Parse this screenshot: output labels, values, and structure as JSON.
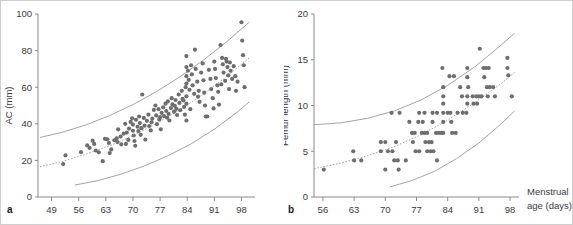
{
  "figure": {
    "panel_letters": {
      "a": "a",
      "b": "b"
    },
    "shared_x_axis_title_line1": "Menstrual",
    "shared_x_axis_title_line2": "age (days)"
  },
  "chart_data": [
    {
      "type": "scatter",
      "panel": "a",
      "title": "",
      "xlabel": "Menstrual age (days)",
      "ylabel": "AC (mm)",
      "xlim": [
        45.5,
        101.5
      ],
      "ylim": [
        0,
        100
      ],
      "xticks": [
        49,
        56,
        63,
        70,
        77,
        84,
        91,
        98
      ],
      "yticks": [
        0,
        20,
        40,
        60,
        80,
        100
      ],
      "grid": false,
      "legend": "none",
      "annotations": [
        "upper reference percentile curve",
        "mean dotted curve",
        "lower reference percentile curve"
      ],
      "curves": [
        {
          "name": "upper",
          "x": [
            46,
            52,
            58,
            64,
            70,
            76,
            82,
            88,
            94,
            100
          ],
          "y": [
            32.5,
            35.5,
            39.5,
            44.5,
            50.5,
            57.5,
            65.5,
            74.5,
            84.5,
            95.5
          ]
        },
        {
          "name": "mean",
          "x": [
            46,
            52,
            58,
            64,
            70,
            76,
            82,
            88,
            94,
            100
          ],
          "y": [
            16.5,
            19.5,
            23.5,
            28.0,
            33.5,
            40.0,
            47.5,
            56.0,
            65.5,
            76.0
          ]
        },
        {
          "name": "lower",
          "x": [
            55,
            61,
            67,
            73,
            79,
            85,
            91,
            97,
            100
          ],
          "y": [
            6.5,
            9.0,
            12.5,
            17.0,
            22.5,
            29.0,
            37.0,
            46.5,
            52.0
          ]
        }
      ],
      "points": [
        [
          52.0,
          18.0
        ],
        [
          52.6,
          22.7
        ],
        [
          56.6,
          24.5
        ],
        [
          58.2,
          28.2
        ],
        [
          58.8,
          26.8
        ],
        [
          59.6,
          30.8
        ],
        [
          60.4,
          25.4
        ],
        [
          61.2,
          24.4
        ],
        [
          62.2,
          19.6
        ],
        [
          63.4,
          31.5
        ],
        [
          63.8,
          29.5
        ],
        [
          64.0,
          24.0
        ],
        [
          64.4,
          26.0
        ],
        [
          65.2,
          31.0
        ],
        [
          65.8,
          32.0
        ],
        [
          66.2,
          37.0
        ],
        [
          66.8,
          33.0
        ],
        [
          67.0,
          28.8
        ],
        [
          67.6,
          34.6
        ],
        [
          68.0,
          40.0
        ],
        [
          68.4,
          35.2
        ],
        [
          68.8,
          31.2
        ],
        [
          69.0,
          37.4
        ],
        [
          69.4,
          41.0
        ],
        [
          69.8,
          43.0
        ],
        [
          70.0,
          39.6
        ],
        [
          70.2,
          33.6
        ],
        [
          70.4,
          30.6
        ],
        [
          70.6,
          28.0
        ],
        [
          70.8,
          42.2
        ],
        [
          71.2,
          38.4
        ],
        [
          71.4,
          36.0
        ],
        [
          71.6,
          44.0
        ],
        [
          71.8,
          40.4
        ],
        [
          72.0,
          34.0
        ],
        [
          72.4,
          56.0
        ],
        [
          72.8,
          43.2
        ],
        [
          73.0,
          39.0
        ],
        [
          73.2,
          31.4
        ],
        [
          73.6,
          41.6
        ],
        [
          74.0,
          45.0
        ],
        [
          74.2,
          38.8
        ],
        [
          74.6,
          36.4
        ],
        [
          75.0,
          42.8
        ],
        [
          75.4,
          47.6
        ],
        [
          75.8,
          50.0
        ],
        [
          76.0,
          44.6
        ],
        [
          76.2,
          39.8
        ],
        [
          76.6,
          48.0
        ],
        [
          77.0,
          43.6
        ],
        [
          77.2,
          37.0
        ],
        [
          77.4,
          46.0
        ],
        [
          77.8,
          49.0
        ],
        [
          78.0,
          44.2
        ],
        [
          78.4,
          51.0
        ],
        [
          78.6,
          47.0
        ],
        [
          79.0,
          52.2
        ],
        [
          79.2,
          45.4
        ],
        [
          79.4,
          41.8
        ],
        [
          79.8,
          48.6
        ],
        [
          80.0,
          54.0
        ],
        [
          80.2,
          50.6
        ],
        [
          80.6,
          46.6
        ],
        [
          81.0,
          53.0
        ],
        [
          81.2,
          48.2
        ],
        [
          81.4,
          44.8
        ],
        [
          81.8,
          56.0
        ],
        [
          82.0,
          51.4
        ],
        [
          82.2,
          47.4
        ],
        [
          82.6,
          58.0
        ],
        [
          83.0,
          52.8
        ],
        [
          83.2,
          49.2
        ],
        [
          83.4,
          45.0
        ],
        [
          83.6,
          60.0
        ],
        [
          83.8,
          77.0
        ],
        [
          83.8,
          71.0
        ],
        [
          83.8,
          66.0
        ],
        [
          83.8,
          62.0
        ],
        [
          83.8,
          55.0
        ],
        [
          83.8,
          51.0
        ],
        [
          83.8,
          41.8
        ],
        [
          84.2,
          69.0
        ],
        [
          84.4,
          64.0
        ],
        [
          84.6,
          58.6
        ],
        [
          85.0,
          72.0
        ],
        [
          85.2,
          67.0
        ],
        [
          85.4,
          61.0
        ],
        [
          85.8,
          56.4
        ],
        [
          86.0,
          80.5
        ],
        [
          86.2,
          70.0
        ],
        [
          86.6,
          63.0
        ],
        [
          87.0,
          58.0
        ],
        [
          87.2,
          52.0
        ],
        [
          87.6,
          68.0
        ],
        [
          88.0,
          73.0
        ],
        [
          88.2,
          63.8
        ],
        [
          88.4,
          57.0
        ],
        [
          88.8,
          44.0
        ],
        [
          89.2,
          44.0
        ],
        [
          89.6,
          69.5
        ],
        [
          90.0,
          64.5
        ],
        [
          90.2,
          59.0
        ],
        [
          90.6,
          54.0
        ],
        [
          91.0,
          74.0
        ],
        [
          91.2,
          70.0
        ],
        [
          91.4,
          65.0
        ],
        [
          91.8,
          61.0
        ],
        [
          92.0,
          57.5
        ],
        [
          92.2,
          50.5
        ],
        [
          92.6,
          83.0
        ],
        [
          93.0,
          76.0
        ],
        [
          93.2,
          72.5
        ],
        [
          93.4,
          68.0
        ],
        [
          93.8,
          63.5
        ],
        [
          94.0,
          75.5
        ],
        [
          94.2,
          74.0
        ],
        [
          94.4,
          71.0
        ],
        [
          94.6,
          66.5
        ],
        [
          95.0,
          73.5
        ],
        [
          95.2,
          69.0
        ],
        [
          95.6,
          64.5
        ],
        [
          96.0,
          71.5
        ],
        [
          96.4,
          66.0
        ],
        [
          97.0,
          63.0
        ],
        [
          98.0,
          95.5
        ],
        [
          98.2,
          85.5
        ],
        [
          98.4,
          77.5
        ],
        [
          98.6,
          72.0
        ],
        [
          98.8,
          60.0
        ],
        [
          60.0,
          29.0
        ],
        [
          62.8,
          31.8
        ],
        [
          66.0,
          30.0
        ],
        [
          68.2,
          29.0
        ],
        [
          70.0,
          36.2
        ],
        [
          72.2,
          37.6
        ],
        [
          74.8,
          40.8
        ],
        [
          76.8,
          42.4
        ],
        [
          78.8,
          43.4
        ],
        [
          80.8,
          49.8
        ],
        [
          82.8,
          53.6
        ],
        [
          84.8,
          48.0
        ],
        [
          86.8,
          54.8
        ],
        [
          88.6,
          50.0
        ],
        [
          90.8,
          48.4
        ],
        [
          92.8,
          61.5
        ],
        [
          94.8,
          59.0
        ],
        [
          96.6,
          58.0
        ]
      ]
    },
    {
      "type": "scatter",
      "panel": "b",
      "title": "",
      "xlabel": "Menstrual age (days)",
      "ylabel": "Femur length (mm)",
      "xlim": [
        54,
        100
      ],
      "ylim": [
        0,
        20
      ],
      "xticks": [
        56,
        63,
        70,
        77,
        84,
        91,
        98
      ],
      "yticks": [
        0,
        5,
        10,
        15,
        20
      ],
      "grid": false,
      "legend": "none",
      "annotations": [
        "upper reference percentile curve",
        "mean dotted curve",
        "lower reference percentile curve"
      ],
      "curves": [
        {
          "name": "upper",
          "x": [
            54,
            60,
            66,
            72,
            78,
            84,
            90,
            96,
            99
          ],
          "y": [
            7.9,
            8.1,
            8.6,
            9.4,
            10.6,
            12.2,
            14.2,
            16.6,
            17.9
          ]
        },
        {
          "name": "mean",
          "x": [
            54,
            60,
            66,
            72,
            78,
            84,
            90,
            96,
            99
          ],
          "y": [
            3.1,
            3.7,
            4.5,
            5.5,
            6.8,
            8.4,
            10.3,
            12.4,
            13.6
          ]
        },
        {
          "name": "lower",
          "x": [
            71,
            76,
            81,
            86,
            91,
            96,
            99
          ],
          "y": [
            1.1,
            1.8,
            2.8,
            4.2,
            5.9,
            8.0,
            9.4
          ]
        }
      ],
      "points": [
        [
          56.2,
          3.0
        ],
        [
          63.0,
          4.0
        ],
        [
          64.6,
          4.0
        ],
        [
          62.8,
          5.0
        ],
        [
          69.0,
          6.0
        ],
        [
          70.0,
          6.0
        ],
        [
          69.0,
          5.0
        ],
        [
          70.6,
          5.0
        ],
        [
          71.6,
          5.0
        ],
        [
          70.0,
          3.0
        ],
        [
          71.4,
          9.2
        ],
        [
          73.2,
          9.2
        ],
        [
          72.4,
          6.0
        ],
        [
          72.0,
          4.0
        ],
        [
          72.8,
          4.0
        ],
        [
          73.0,
          3.0
        ],
        [
          74.6,
          4.0
        ],
        [
          75.4,
          8.2
        ],
        [
          76.0,
          7.0
        ],
        [
          76.6,
          7.0
        ],
        [
          76.2,
          6.0
        ],
        [
          76.8,
          5.0
        ],
        [
          77.6,
          5.0
        ],
        [
          77.6,
          9.2
        ],
        [
          78.8,
          9.2
        ],
        [
          77.4,
          8.2
        ],
        [
          78.4,
          8.2
        ],
        [
          78.2,
          7.0
        ],
        [
          78.8,
          7.0
        ],
        [
          79.4,
          7.0
        ],
        [
          79.0,
          6.0
        ],
        [
          79.8,
          6.0
        ],
        [
          80.4,
          6.0
        ],
        [
          79.4,
          5.0
        ],
        [
          80.2,
          5.0
        ],
        [
          80.8,
          5.0
        ],
        [
          80.6,
          9.2
        ],
        [
          81.6,
          9.2
        ],
        [
          80.6,
          8.2
        ],
        [
          81.4,
          7.0
        ],
        [
          82.0,
          7.0
        ],
        [
          82.6,
          7.0
        ],
        [
          81.6,
          4.0
        ],
        [
          82.8,
          14.1
        ],
        [
          83.0,
          12.0
        ],
        [
          83.0,
          11.0
        ],
        [
          83.0,
          10.2
        ],
        [
          83.0,
          9.2
        ],
        [
          83.0,
          8.2
        ],
        [
          83.0,
          7.0
        ],
        [
          84.0,
          9.2
        ],
        [
          84.6,
          9.2
        ],
        [
          84.4,
          13.2
        ],
        [
          85.4,
          13.2
        ],
        [
          84.8,
          8.2
        ],
        [
          85.0,
          7.0
        ],
        [
          85.8,
          7.0
        ],
        [
          86.2,
          9.2
        ],
        [
          86.8,
          12.0
        ],
        [
          87.2,
          11.0
        ],
        [
          87.4,
          9.2
        ],
        [
          88.4,
          14.1
        ],
        [
          88.4,
          13.1
        ],
        [
          88.6,
          12.0
        ],
        [
          88.4,
          11.0
        ],
        [
          88.4,
          10.2
        ],
        [
          88.2,
          9.2
        ],
        [
          89.6,
          11.0
        ],
        [
          90.4,
          11.0
        ],
        [
          91.0,
          11.0
        ],
        [
          91.6,
          11.0
        ],
        [
          89.8,
          10.2
        ],
        [
          90.6,
          10.2
        ],
        [
          91.2,
          16.2
        ],
        [
          92.0,
          14.1
        ],
        [
          92.6,
          14.1
        ],
        [
          93.2,
          14.1
        ],
        [
          92.2,
          13.1
        ],
        [
          92.8,
          12.0
        ],
        [
          93.4,
          12.0
        ],
        [
          93.0,
          11.0
        ],
        [
          94.2,
          12.0
        ],
        [
          94.6,
          11.0
        ],
        [
          97.4,
          15.2
        ],
        [
          97.4,
          14.1
        ],
        [
          97.6,
          13.3
        ],
        [
          98.4,
          11.0
        ]
      ]
    }
  ]
}
